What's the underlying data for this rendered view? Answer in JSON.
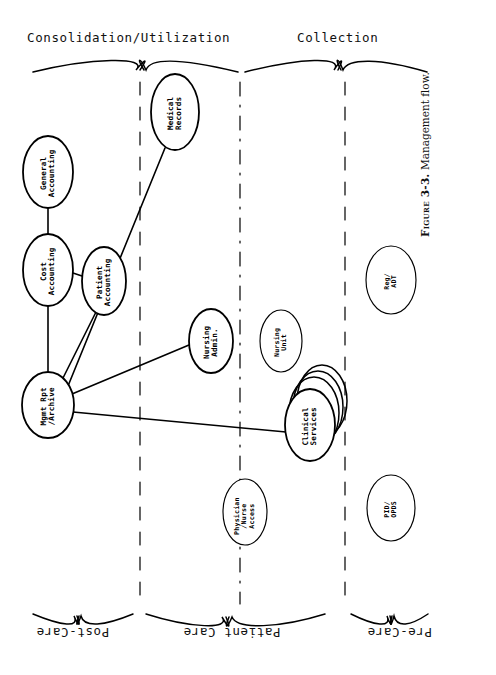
{
  "figure": {
    "caption_prefix": "Figure 3-3.",
    "caption_text": "Management flow."
  },
  "zones": {
    "top": [
      {
        "id": "consolidation",
        "label": "Consolidation/Utilization"
      },
      {
        "id": "collection",
        "label": "Collection"
      }
    ],
    "bottom": [
      {
        "id": "post-care",
        "label": "Post-Care"
      },
      {
        "id": "patient-care",
        "label": "Patient Care"
      },
      {
        "id": "pre-care",
        "label": "Pre-Care"
      }
    ]
  },
  "nodes": [
    {
      "id": "medical-records",
      "label": "Medical\nRecords",
      "cx": 175,
      "cy": 112,
      "rx": 24,
      "ry": 38
    },
    {
      "id": "general-accounting",
      "label": "General\nAccounting",
      "cx": 48,
      "cy": 172,
      "rx": 25,
      "ry": 36
    },
    {
      "id": "cost-accounting",
      "label": "Cost\nAccounting",
      "cx": 48,
      "cy": 270,
      "rx": 25,
      "ry": 36
    },
    {
      "id": "patient-accounting",
      "label": "Patient\nAccounting",
      "cx": 104,
      "cy": 281,
      "rx": 22,
      "ry": 34
    },
    {
      "id": "nursing-admin",
      "label": "Nursing\nAdmin.",
      "cx": 211,
      "cy": 341,
      "rx": 22,
      "ry": 32
    },
    {
      "id": "nursing-unit",
      "label": "Nursing\nUnit",
      "cx": 281,
      "cy": 341,
      "rx": 21,
      "ry": 31
    },
    {
      "id": "mgmt-rpt-archive",
      "label": "Mgmt Rpt\n/Archive",
      "cx": 48,
      "cy": 405,
      "rx": 26,
      "ry": 33
    },
    {
      "id": "clinical-services",
      "label": "Clinical\nServices",
      "cx": 310,
      "cy": 425,
      "rx": 25,
      "ry": 36
    },
    {
      "id": "physician-nurse-access",
      "label": "Physician\n/Nurse\nAccess",
      "cx": 245,
      "cy": 512,
      "rx": 22,
      "ry": 33
    },
    {
      "id": "reg-adt",
      "label": "Reg/\nADT",
      "cx": 391,
      "cy": 280,
      "rx": 25,
      "ry": 34
    },
    {
      "id": "pid-opds",
      "label": "PID/\nOPDS",
      "cx": 391,
      "cy": 508,
      "rx": 24,
      "ry": 33
    }
  ],
  "edges": [
    {
      "id": "general-to-cost",
      "from": "general-accounting",
      "to": "cost-accounting"
    },
    {
      "id": "cost-to-patient",
      "from": "cost-accounting",
      "to": "patient-accounting"
    },
    {
      "id": "cost-to-mgmt",
      "from": "cost-accounting",
      "to": "mgmt-rpt-archive"
    },
    {
      "id": "patient-to-mgmt",
      "from": "patient-accounting",
      "to": "mgmt-rpt-archive"
    },
    {
      "id": "medical-records-to-mgmt",
      "from": "medical-records",
      "to": "mgmt-rpt-archive"
    },
    {
      "id": "nursing-admin-to-mgmt",
      "from": "nursing-admin",
      "to": "mgmt-rpt-archive"
    },
    {
      "id": "clinical-to-mgmt",
      "from": "clinical-services",
      "to": "mgmt-rpt-archive"
    }
  ],
  "dividers": [
    {
      "id": "divider-1",
      "x": 140,
      "style": "dashed"
    },
    {
      "id": "divider-2",
      "x": 240,
      "style": "dash-dot"
    },
    {
      "id": "divider-3",
      "x": 345,
      "style": "dashed"
    }
  ],
  "colors": {
    "ink": "#000000",
    "paper": "#ffffff"
  }
}
